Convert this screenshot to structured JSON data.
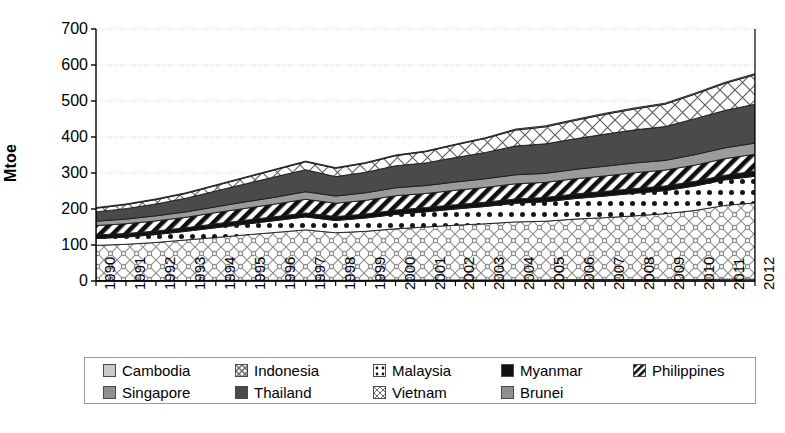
{
  "chart_data": {
    "type": "area",
    "stacked": true,
    "title": "",
    "xlabel": "",
    "ylabel": "Mtoe",
    "ylim": [
      0,
      700
    ],
    "yticks": [
      0,
      100,
      200,
      300,
      400,
      500,
      600,
      700
    ],
    "grid": true,
    "legend_position": "bottom",
    "categories": [
      "1990",
      "1991",
      "1992",
      "1993",
      "1994",
      "1995",
      "1996",
      "1997",
      "1998",
      "1999",
      "2000",
      "2001",
      "2002",
      "2003",
      "2004",
      "2005",
      "2006",
      "2007",
      "2008",
      "2009",
      "2010",
      "2011",
      "2012"
    ],
    "series": [
      {
        "name": "Cambodia",
        "pattern": "solid-light-gray",
        "color": "#c9c9c9",
        "values": [
          1,
          1,
          1,
          1,
          2,
          2,
          2,
          2,
          2,
          2,
          3,
          3,
          3,
          3,
          3,
          3,
          4,
          4,
          4,
          4,
          4,
          5,
          5
        ]
      },
      {
        "name": "Indonesia",
        "pattern": "circle-crosshatch",
        "color": "#e2e2e2",
        "values": [
          98,
          101,
          106,
          113,
          119,
          126,
          133,
          140,
          132,
          136,
          142,
          147,
          152,
          156,
          161,
          163,
          168,
          172,
          177,
          183,
          192,
          205,
          212
        ]
      },
      {
        "name": "Malaysia",
        "pattern": "dotted",
        "color": "#ffffff",
        "values": [
          19,
          20,
          22,
          24,
          27,
          30,
          33,
          36,
          34,
          37,
          40,
          42,
          45,
          48,
          52,
          54,
          57,
          60,
          63,
          64,
          68,
          71,
          74
        ]
      },
      {
        "name": "Myanmar",
        "pattern": "solid-black",
        "color": "#111111",
        "values": [
          10,
          10,
          10,
          10,
          11,
          11,
          11,
          11,
          11,
          11,
          12,
          12,
          12,
          12,
          12,
          12,
          13,
          13,
          13,
          13,
          13,
          13,
          14
        ]
      },
      {
        "name": "Philippines",
        "pattern": "diagonal-stripe",
        "color": "#ffffff",
        "values": [
          26,
          27,
          28,
          29,
          31,
          33,
          35,
          38,
          37,
          38,
          40,
          39,
          40,
          41,
          42,
          42,
          42,
          43,
          44,
          44,
          45,
          46,
          47
        ]
      },
      {
        "name": "Singapore",
        "pattern": "solid-gray",
        "color": "#9b9b9b",
        "values": [
          12,
          13,
          14,
          15,
          16,
          18,
          19,
          21,
          20,
          21,
          22,
          22,
          23,
          24,
          25,
          25,
          26,
          27,
          27,
          27,
          29,
          30,
          31
        ]
      },
      {
        "name": "Thailand",
        "pattern": "solid-dark-gray",
        "color": "#4a4a4a",
        "values": [
          26,
          29,
          33,
          38,
          44,
          50,
          57,
          61,
          54,
          57,
          61,
          63,
          68,
          73,
          80,
          82,
          85,
          89,
          92,
          94,
          100,
          104,
          108
        ]
      },
      {
        "name": "Vietnam",
        "pattern": "x-crosshatch",
        "color": "#f2f2f2",
        "values": [
          10,
          11,
          12,
          13,
          15,
          17,
          19,
          22,
          23,
          25,
          28,
          31,
          35,
          39,
          44,
          47,
          51,
          55,
          58,
          62,
          68,
          75,
          82
        ],
        "note": "top band of stack"
      },
      {
        "name": "Brunei",
        "pattern": "solid-gray",
        "color": "#9b9b9b",
        "values": [
          2,
          2,
          2,
          2,
          2,
          2,
          2,
          2,
          2,
          2,
          2,
          2,
          2,
          2,
          3,
          3,
          3,
          3,
          3,
          3,
          3,
          3,
          3
        ]
      }
    ],
    "totals": [
      204,
      214,
      228,
      245,
      267,
      289,
      311,
      333,
      315,
      329,
      350,
      361,
      380,
      398,
      422,
      431,
      449,
      466,
      481,
      494,
      522,
      552,
      576
    ]
  },
  "axis": {
    "y_tick_labels": [
      "700",
      "600",
      "500",
      "400",
      "300",
      "200",
      "100",
      "0"
    ],
    "x_tick_labels": [
      "1990",
      "1991",
      "1992",
      "1993",
      "1994",
      "1995",
      "1996",
      "1997",
      "1998",
      "1999",
      "2000",
      "2001",
      "2002",
      "2003",
      "2004",
      "2005",
      "2006",
      "2007",
      "2008",
      "2009",
      "2010",
      "2011",
      "2012"
    ],
    "y_axis_title": "Mtoe"
  },
  "legend": {
    "row1": [
      {
        "label": "Cambodia",
        "swatch": "solid-light-gray"
      },
      {
        "label": "Indonesia",
        "swatch": "circle-crosshatch"
      },
      {
        "label": "Malaysia",
        "swatch": "dotted"
      },
      {
        "label": "Myanmar",
        "swatch": "solid-black"
      },
      {
        "label": "Philippines",
        "swatch": "diagonal-stripe"
      }
    ],
    "row2": [
      {
        "label": "Singapore",
        "swatch": "solid-gray"
      },
      {
        "label": "Thailand",
        "swatch": "solid-dark-gray"
      },
      {
        "label": "Vietnam",
        "swatch": "x-crosshatch"
      },
      {
        "label": "Brunei",
        "swatch": "solid-gray"
      }
    ]
  },
  "colors": {
    "axis": "#000000",
    "grid": "#cfcfcf",
    "background": "#ffffff",
    "legend_border": "#9a9a9a"
  }
}
